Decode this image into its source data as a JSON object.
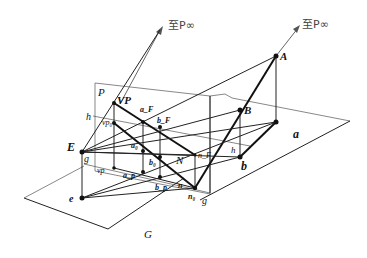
{
  "figure": {
    "arrow_labels": {
      "left": "至P∞",
      "right": "至P∞"
    },
    "planes": {
      "picture_plane": "P",
      "ground_plane": "G",
      "object_plane": "a"
    },
    "points": {
      "A": "A",
      "B": "B",
      "b": "b",
      "E": "E",
      "e": "e",
      "VP": "VP",
      "vp0": "vp₀",
      "vp": "vp",
      "aF": "a_F",
      "bF": "b_F",
      "a0": "a₀",
      "b0": "b₀",
      "ap": "a_p",
      "bp": "b_p",
      "N": "N",
      "nF": "n_F",
      "n0": "n₀",
      "n": "n",
      "h_left": "h",
      "h_right": "h",
      "g_left": "g",
      "g_right": "g"
    }
  }
}
